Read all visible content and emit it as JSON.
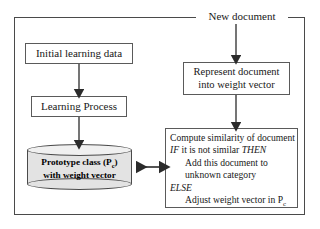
{
  "diagram": {
    "frame": {
      "name": "outer-frame"
    },
    "external_label": {
      "text": "New document"
    },
    "boxes": [
      {
        "id": "initial-data",
        "text": "Initial learning data"
      },
      {
        "id": "learning-process",
        "text": "Learning Process"
      },
      {
        "id": "represent-document",
        "line1": "Represent document",
        "line2": "into weight vector"
      }
    ],
    "datastore": {
      "line1_pre": "Prototype class (P",
      "line1_sub": "c",
      "line1_post": ")",
      "line2": "with weight vector"
    },
    "pseudocode": {
      "line1": "Compute similarity of document",
      "line2_kw1": "IF",
      "line2_mid": " it is not similar ",
      "line2_kw2": "THEN",
      "line3": "Add this document to",
      "line4": "unknown category",
      "line5_kw": "ELSE",
      "line6_pre": "Adjust weight vector in P",
      "line6_sub": "c"
    },
    "arrows": [
      {
        "name": "arrow-new-document-to-represent",
        "type": "down"
      },
      {
        "name": "arrow-initial-data-to-learning-process",
        "type": "down"
      },
      {
        "name": "arrow-learning-process-to-prototype-class",
        "type": "down"
      },
      {
        "name": "arrow-represent-to-compute",
        "type": "down"
      },
      {
        "name": "arrow-prototype-class-compute-bidirectional",
        "type": "double-horizontal"
      }
    ],
    "colors": {
      "stroke": "#4a4a4a",
      "cylinder_fill": "#e3e3e3",
      "background": "#ffffff",
      "text": "#181818"
    }
  }
}
